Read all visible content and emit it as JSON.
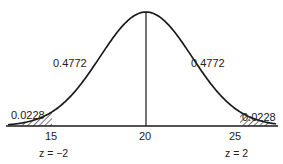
{
  "diagram": {
    "type": "normal-distribution-curve",
    "mean": 20,
    "stroke_color": "#1a1a1a",
    "areas": {
      "left_center": "0.4772",
      "right_center": "0.4772",
      "left_tail": "0.0228",
      "right_tail": "0.0228"
    },
    "axis_ticks": [
      {
        "value": "15",
        "z_label": "z = −2"
      },
      {
        "value": "20",
        "z_label": ""
      },
      {
        "value": "25",
        "z_label": "z = 2"
      }
    ]
  }
}
